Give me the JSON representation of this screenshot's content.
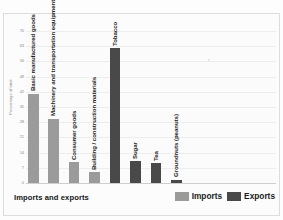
{
  "chart_data": {
    "type": "bar",
    "title": "Imports and exports",
    "xlabel": "",
    "ylabel": "Percentage of total",
    "ylim": [
      0,
      70
    ],
    "ytick_step": 7,
    "yticks": [
      70,
      63,
      56,
      49,
      42,
      35,
      28,
      21,
      14,
      7,
      0
    ],
    "grid": true,
    "legend_position": "bottom-right",
    "categories": [
      "Basic manufactured goods",
      "Machinery and transportation equipment",
      "Consumer goods",
      "Building / construction materials",
      "Tobacco",
      "Sugar",
      "Tea",
      "Groundnuts (peanuts)"
    ],
    "series": [
      {
        "name": "Imports",
        "color": "#9b9b9b",
        "values": [
          41,
          29.5,
          9.5,
          5,
          null,
          null,
          null,
          null
        ]
      },
      {
        "name": "Exports",
        "color": "#494949",
        "values": [
          null,
          null,
          null,
          null,
          62,
          10,
          9,
          1.5
        ]
      }
    ],
    "bars": [
      {
        "category": "Basic manufactured goods",
        "series": "Imports",
        "value": 41
      },
      {
        "category": "Machinery and transportation equipment",
        "series": "Imports",
        "value": 29.5
      },
      {
        "category": "Consumer goods",
        "series": "Imports",
        "value": 9.5
      },
      {
        "category": "Building / construction materials",
        "series": "Imports",
        "value": 5
      },
      {
        "category": "Tobacco",
        "series": "Exports",
        "value": 62
      },
      {
        "category": "Sugar",
        "series": "Exports",
        "value": 10
      },
      {
        "category": "Tea",
        "series": "Exports",
        "value": 9
      },
      {
        "category": "Groundnuts (peanuts)",
        "series": "Exports",
        "value": 1.5
      }
    ]
  },
  "axis": {
    "y_title": "Percentage of total",
    "ticks": [
      "70",
      "63",
      "56",
      "49",
      "42",
      "35",
      "28",
      "21",
      "14",
      "7",
      "0"
    ]
  },
  "labels": {
    "bar_0": "Basic manufactured goods",
    "bar_1": "Machinery and transportation equipment",
    "bar_2": "Consumer goods",
    "bar_3": "Building / construction materials",
    "bar_4": "Tobacco",
    "bar_5": "Sugar",
    "bar_6": "Tea",
    "bar_7": "Groundnuts (peanuts)"
  },
  "footer": {
    "title": "Imports and exports",
    "legend": [
      {
        "label": "Imports",
        "color": "#9b9b9b"
      },
      {
        "label": "Exports",
        "color": "#494949"
      }
    ]
  }
}
